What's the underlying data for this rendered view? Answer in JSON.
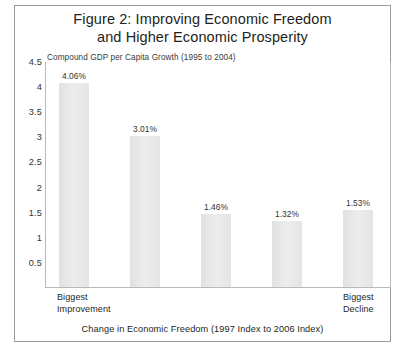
{
  "figure": {
    "title_line1": "Figure 2: Improving Economic Freedom",
    "title_line2": "and Higher Economic Prosperity",
    "subtitle": "Compound GDP per Capita Growth (1995 to 2004)",
    "xaxis_title": "Change in Economic Freedom (1997 Index to 2006 Index)",
    "left_category_line1": "Biggest",
    "left_category_line2": "Improvement",
    "right_category_line1": "Biggest",
    "right_category_line2": "Decline",
    "frame_color": "#9b9b9b",
    "bar_color": "#e8e8e8",
    "text_color": "#231f20"
  },
  "chart_data": {
    "type": "bar",
    "title": "Figure 2: Improving Economic Freedom and Higher Economic Prosperity",
    "subtitle": "Compound GDP per Capita Growth (1995 to 2004)",
    "xlabel": "Change in Economic Freedom (1997 Index to 2006 Index)",
    "ylabel": "",
    "ylim": [
      0,
      4.5
    ],
    "ytick_labels": [
      "4.5",
      "4",
      "3.5",
      "3",
      "2.5",
      "2",
      "1.5",
      "1",
      "0.5"
    ],
    "ytick_values": [
      4.5,
      4,
      3.5,
      3,
      2.5,
      2,
      1.5,
      1,
      0.5
    ],
    "grid": false,
    "legend": "none",
    "categories": [
      "Quintile 1",
      "Quintile 2",
      "Quintile 3",
      "Quintile 4",
      "Quintile 5"
    ],
    "category_axis_labels": [
      "Biggest Improvement",
      "",
      "",
      "",
      "Biggest Decline"
    ],
    "values": [
      4.06,
      3.01,
      1.46,
      1.32,
      1.53
    ],
    "value_labels": [
      "4.06%",
      "3.01%",
      "1.46%",
      "1.32%",
      "1.53%"
    ],
    "bars": [
      {
        "label": "4.06%",
        "value": 4.06,
        "left_px": 58,
        "width_px": 30
      },
      {
        "label": "3.01%",
        "value": 3.01,
        "left_px": 129,
        "width_px": 30
      },
      {
        "label": "1.46%",
        "value": 1.46,
        "left_px": 200,
        "width_px": 30
      },
      {
        "label": "1.32%",
        "value": 1.32,
        "left_px": 271,
        "width_px": 30
      },
      {
        "label": "1.53%",
        "value": 1.53,
        "left_px": 342,
        "width_px": 30
      }
    ]
  }
}
